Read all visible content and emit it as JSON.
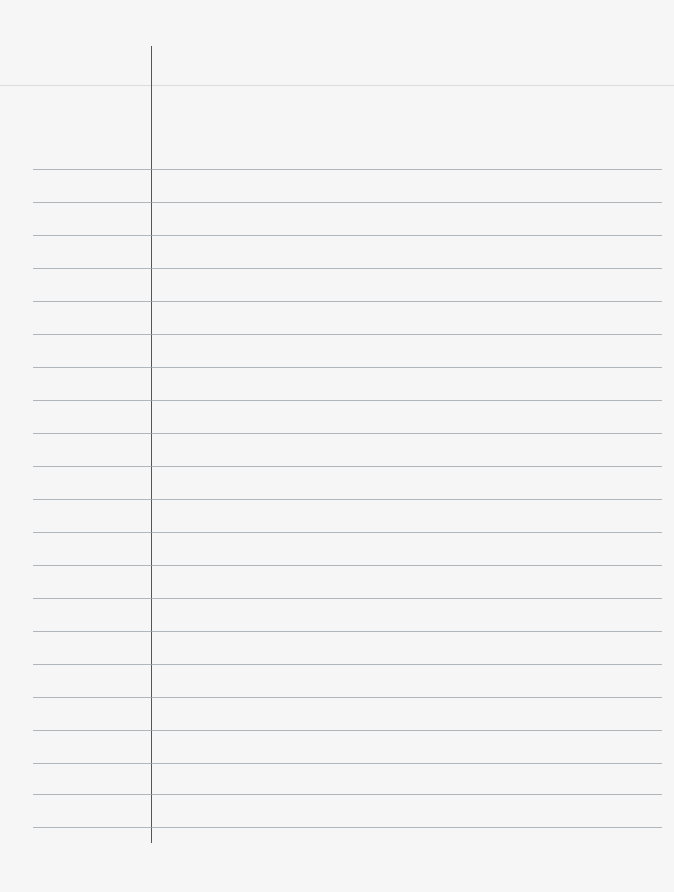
{
  "page": {
    "type": "blank ruled notebook paper",
    "text_content": "",
    "colors": {
      "paper": "#f6f6f6",
      "rule_line": "#9aa0a6",
      "margin_line": "#555555"
    },
    "margin_line": {
      "x": 151,
      "y_start": 46,
      "y_end": 843
    },
    "header_line_y": 85,
    "rule_lines_y": [
      169,
      202,
      235,
      268,
      301,
      334,
      367,
      400,
      433,
      466,
      499,
      532,
      565,
      598,
      631,
      664,
      697,
      730,
      763,
      794,
      827
    ]
  }
}
